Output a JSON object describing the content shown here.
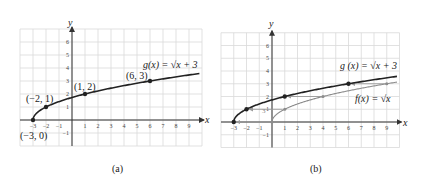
{
  "figure": {
    "panels": [
      {
        "caption": "(a)",
        "x_axis_label": "x",
        "y_axis_label": "y",
        "equation_label": "g(x) = √x + 3",
        "point_labels": [
          "(−3, 0)",
          "(−2, 1)",
          "(1, 2)",
          "(6, 3)"
        ]
      },
      {
        "caption": "(b)",
        "x_axis_label": "x",
        "y_axis_label": "y",
        "equation_label_g": "g (x) = √x + 3",
        "equation_label_f": "f(x) = √x",
        "shift_label": "3"
      }
    ]
  },
  "chart_data": [
    {
      "type": "line",
      "title": "(a)",
      "xlabel": "x",
      "ylabel": "y",
      "xlim": [
        -4,
        10
      ],
      "ylim": [
        -2,
        7
      ],
      "x_ticks": [
        -3,
        -2,
        -1,
        1,
        2,
        3,
        4,
        5,
        6,
        7,
        8,
        9
      ],
      "y_ticks": [
        -1,
        1,
        2,
        3,
        4,
        5,
        6
      ],
      "grid": true,
      "series": [
        {
          "name": "g(x) = √(x + 3)",
          "function": "sqrt(x+3)",
          "color": "#222222",
          "domain": [
            -3,
            9.8
          ],
          "marked_points": [
            {
              "x": -3,
              "y": 0,
              "label": "(−3, 0)"
            },
            {
              "x": -2,
              "y": 1,
              "label": "(−2, 1)"
            },
            {
              "x": 1,
              "y": 2,
              "label": "(1, 2)"
            },
            {
              "x": 6,
              "y": 3,
              "label": "(6, 3)"
            }
          ]
        }
      ]
    },
    {
      "type": "line",
      "title": "(b)",
      "xlabel": "x",
      "ylabel": "y",
      "xlim": [
        -4,
        10
      ],
      "ylim": [
        -2,
        7
      ],
      "x_ticks": [
        -3,
        -2,
        -1,
        1,
        2,
        3,
        4,
        5,
        6,
        7,
        8,
        9
      ],
      "y_ticks": [
        -1,
        1,
        2,
        3,
        4,
        5,
        6
      ],
      "grid": true,
      "series": [
        {
          "name": "g(x) = √(x + 3)",
          "function": "sqrt(x+3)",
          "color": "#222222",
          "domain": [
            -3,
            9.8
          ],
          "marked_points": [
            {
              "x": -3,
              "y": 0
            },
            {
              "x": -2,
              "y": 1
            },
            {
              "x": 1,
              "y": 2
            },
            {
              "x": 6,
              "y": 3
            }
          ]
        },
        {
          "name": "f(x) = √x",
          "function": "sqrt(x)",
          "color": "#8c8c8c",
          "domain": [
            0,
            9.8
          ],
          "marked_points": [
            {
              "x": 0,
              "y": 0
            },
            {
              "x": 1,
              "y": 1
            },
            {
              "x": 4,
              "y": 2
            },
            {
              "x": 9,
              "y": 3
            }
          ]
        }
      ],
      "annotations": [
        {
          "type": "arrow",
          "from": [
            0,
            0
          ],
          "to": [
            -3,
            0
          ]
        },
        {
          "type": "arrow",
          "from": [
            1,
            1
          ],
          "to": [
            -2,
            1
          ]
        },
        {
          "type": "arrow",
          "from": [
            4,
            2
          ],
          "to": [
            1,
            2
          ]
        },
        {
          "type": "arrow",
          "from": [
            9,
            3
          ],
          "to": [
            6,
            3
          ]
        },
        {
          "type": "text",
          "text": "3",
          "note": "horizontal shift of 3 units left"
        }
      ]
    }
  ]
}
